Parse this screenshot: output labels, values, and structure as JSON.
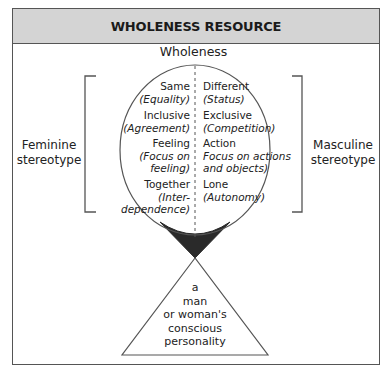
{
  "header": {
    "title": "WHOLENESS RESOURCE"
  },
  "diagram": {
    "title": "Wholeness",
    "left_label": [
      "Feminine",
      "stereotype"
    ],
    "right_label": [
      "Masculine",
      "stereotype"
    ],
    "left_column": [
      {
        "term": "Same",
        "note": [
          "(Equality)"
        ]
      },
      {
        "term": "Inclusive",
        "note": [
          "(Agreement)"
        ]
      },
      {
        "term": "Feeling",
        "note": [
          "(Focus on",
          "feeling)"
        ]
      },
      {
        "term": "Together",
        "note": [
          "(Inter-",
          "dependence)"
        ]
      }
    ],
    "right_column": [
      {
        "term": "Different",
        "note": [
          "(Status)"
        ]
      },
      {
        "term": "Exclusive",
        "note": [
          "(Competition)"
        ]
      },
      {
        "term": "Action",
        "note": [
          "Focus on actions",
          "and objects)"
        ]
      },
      {
        "term": "Lone",
        "note": [
          "(Autonomy)"
        ]
      }
    ],
    "triangle_text": [
      "a",
      "man",
      "or woman's",
      "conscious",
      "personality"
    ]
  },
  "colors": {
    "header_bg": "#d4d4d4",
    "line": "#555555",
    "wedge": "#2a2a2a"
  }
}
